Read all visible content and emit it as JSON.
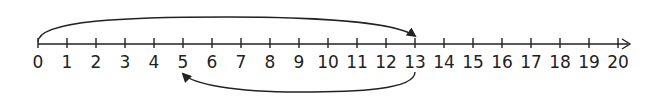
{
  "diagram": {
    "type": "number-line",
    "start": 0,
    "end": 20,
    "step": 1,
    "labels": [
      "0",
      "1",
      "2",
      "3",
      "4",
      "5",
      "6",
      "7",
      "8",
      "9",
      "10",
      "11",
      "12",
      "13",
      "14",
      "15",
      "16",
      "17",
      "18",
      "19",
      "20"
    ],
    "colors": {
      "line": "#222222",
      "background": "#ffffff"
    },
    "jumps": [
      {
        "from": 0,
        "to": 13,
        "position": "above",
        "direction": "forward"
      },
      {
        "from": 13,
        "to": 5,
        "position": "below",
        "direction": "backward"
      }
    ]
  }
}
